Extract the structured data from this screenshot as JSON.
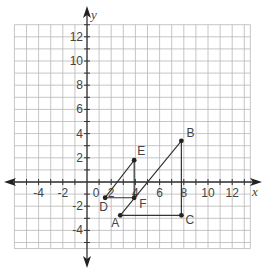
{
  "diagram": {
    "type": "coordinate-plane",
    "axes": {
      "x_label": "x",
      "y_label": "y",
      "origin_label": "0"
    },
    "x_ticks": [
      "-4",
      "-2",
      "2",
      "4",
      "6",
      "8",
      "10",
      "12"
    ],
    "y_ticks": [
      "12",
      "10",
      "8",
      "6",
      "4",
      "2",
      "-2",
      "-4"
    ],
    "grid": {
      "x_min": -6,
      "x_max": 13.5,
      "y_min": -5.5,
      "y_max": 13,
      "step": 1
    },
    "points": [
      {
        "name": "A",
        "x": 2.75,
        "y": -2.75
      },
      {
        "name": "B",
        "x": 7.8,
        "y": 3.4
      },
      {
        "name": "C",
        "x": 7.8,
        "y": -2.75
      },
      {
        "name": "D",
        "x": 1.5,
        "y": -1.3
      },
      {
        "name": "E",
        "x": 3.9,
        "y": 1.8
      },
      {
        "name": "F",
        "x": 3.9,
        "y": -1.3
      }
    ],
    "triangles": [
      {
        "name": "ABC",
        "vertices": [
          "A",
          "B",
          "C"
        ]
      },
      {
        "name": "DEF",
        "vertices": [
          "D",
          "E",
          "F"
        ]
      }
    ]
  }
}
